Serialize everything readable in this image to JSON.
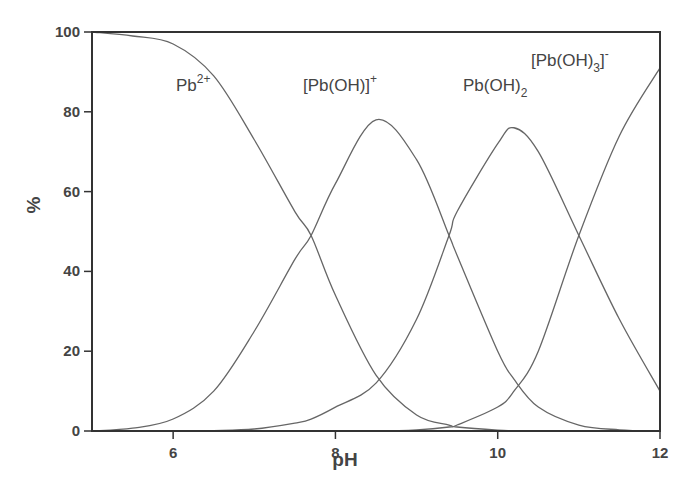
{
  "chart_data": {
    "type": "line",
    "title": "",
    "xlabel": "pH",
    "ylabel": "%",
    "xlim": [
      5,
      12
    ],
    "ylim": [
      0,
      100
    ],
    "x_ticks": [
      6,
      8,
      10,
      12
    ],
    "y_ticks": [
      0,
      20,
      40,
      60,
      80,
      100
    ],
    "grid": false,
    "legend": "inline labels",
    "x": [
      5.0,
      5.5,
      6.0,
      6.5,
      7.0,
      7.5,
      7.7,
      8.0,
      8.5,
      9.0,
      9.4,
      9.5,
      10.0,
      10.2,
      10.5,
      11.0,
      11.5,
      12.0
    ],
    "series": [
      {
        "name": "Pb2+",
        "label_main": "Pb",
        "label_sup": "2+",
        "values": [
          100,
          99,
          97,
          89,
          73,
          55,
          49,
          34,
          14,
          4,
          1.5,
          1,
          0.2,
          0.1,
          0,
          0,
          0,
          0
        ]
      },
      {
        "name": "[Pb(OH)]+",
        "label_main": "[Pb(OH)]",
        "label_sup": "+",
        "values": [
          0,
          0.7,
          3,
          10,
          25,
          43,
          49,
          62,
          78,
          68,
          49,
          44,
          20,
          13,
          6,
          1.5,
          0.3,
          0
        ]
      },
      {
        "name": "Pb(OH)2",
        "label_main": "Pb(OH)",
        "label_sub": "2",
        "values": [
          0,
          0,
          0,
          0.1,
          0.5,
          2,
          3,
          6,
          12,
          28,
          49,
          55,
          72,
          76,
          70,
          49,
          28,
          10
        ]
      },
      {
        "name": "[Pb(OH)3]-",
        "label_main": "[Pb(OH)",
        "label_sub": "3",
        "label_tail": "]",
        "label_sup": "-",
        "values": [
          0,
          0,
          0,
          0,
          0,
          0,
          0,
          0,
          0,
          0.3,
          1,
          1.5,
          6,
          10,
          20,
          49,
          74,
          91
        ]
      }
    ]
  }
}
